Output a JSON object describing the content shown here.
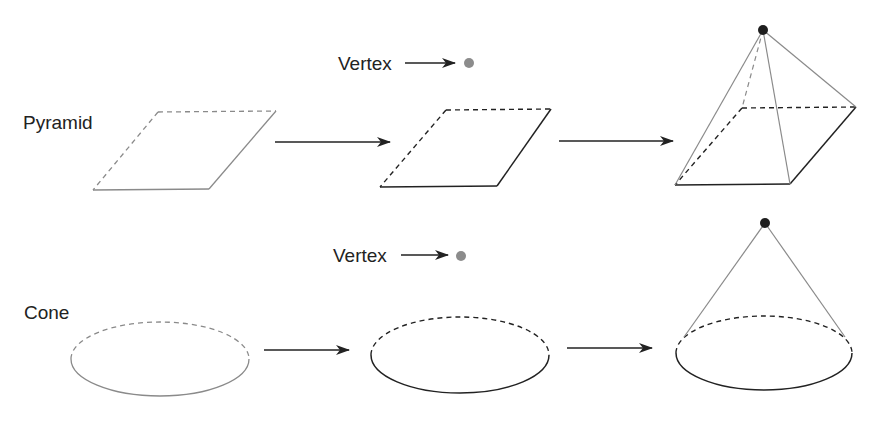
{
  "diagram": {
    "title": "",
    "rows": [
      {
        "id": "pyramid",
        "label": "Pyramid",
        "vertex_label": "Vertex",
        "steps": [
          "dashed/gray base (parallelogram)",
          "base with vertex point",
          "pyramid formed by joining vertex to base"
        ]
      },
      {
        "id": "cone",
        "label": "Cone",
        "vertex_label": "Vertex",
        "steps": [
          "dashed/gray base (ellipse)",
          "base with vertex point",
          "cone formed by joining vertex to base"
        ]
      }
    ],
    "colors": {
      "stroke_dark": "#222222",
      "stroke_light": "#8a8a8a",
      "vertex_gray": "#8c8c8c",
      "vertex_dark": "#1e1e1e",
      "background": "#ffffff"
    }
  }
}
